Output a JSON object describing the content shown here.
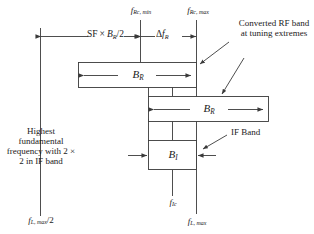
{
  "diagram": {
    "stroke_color": "#3a3a3a",
    "box_fill": "#ffffff",
    "text_color": "#1a1a1a",
    "background": "#ffffff"
  },
  "top_markers": {
    "left_tick_label": {
      "base": "f",
      "sub": "Rc, min"
    },
    "right_tick_label": {
      "base": "f",
      "sub": "Rc, max"
    }
  },
  "dimensions": {
    "sf_span": {
      "prefix": "SF",
      "times": "×",
      "base": "B",
      "sub": "R",
      "suffix": "/2"
    },
    "delta_span": {
      "delta": "Δ",
      "base": "f",
      "sub": "R"
    }
  },
  "boxes": {
    "rf_box_top": {
      "base": "B",
      "sub": "R"
    },
    "rf_box_bottom": {
      "base": "B",
      "sub": "R"
    },
    "if_box": {
      "base": "B",
      "sub": "I"
    }
  },
  "annotations": {
    "converted_rf": "Converted RF band at tuning extremes",
    "if_band": "IF Band",
    "highest_fundamental": "Highest fundamental frequency with 2 × 2 in IF band"
  },
  "bottom_labels": {
    "left": {
      "base": "f",
      "sub": "L, max",
      "suffix": "/2"
    },
    "center": {
      "base": "f",
      "sub": "Ic"
    },
    "right": {
      "base": "f",
      "sub": "L, max"
    }
  }
}
